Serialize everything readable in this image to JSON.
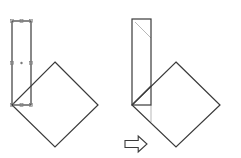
{
  "diagram": {
    "colors": {
      "stroke": "#3a3a3a",
      "guide": "#9a9a9a",
      "handle": "#7a7a7a",
      "background": "#ffffff"
    },
    "panels": [
      {
        "id": "before",
        "rectangle": {
          "x": 12,
          "y": 21,
          "width": 19,
          "height": 84,
          "selected": true
        },
        "diamond": {
          "top": [
            55,
            62
          ],
          "right": [
            98,
            105
          ],
          "bottom": [
            55,
            147
          ],
          "left": [
            12,
            105
          ]
        },
        "handles": [
          [
            12,
            21
          ],
          [
            21.5,
            21
          ],
          [
            31,
            21
          ],
          [
            12,
            63
          ],
          [
            31,
            63
          ],
          [
            12,
            105
          ],
          [
            21.5,
            105
          ],
          [
            31,
            105
          ]
        ],
        "center_marker": [
          21.5,
          63
        ]
      },
      {
        "id": "after",
        "rectangle": {
          "x": 132,
          "y": 19,
          "width": 19,
          "height": 86,
          "selected": false
        },
        "diamond": {
          "top": [
            176,
            62
          ],
          "right": [
            220,
            105
          ],
          "bottom": [
            176,
            147
          ],
          "left": [
            132,
            105
          ]
        },
        "guide_lines": [
          {
            "from": [
              135,
              22
            ],
            "to": [
              151,
              38
            ]
          },
          {
            "from": [
              151,
              105
            ],
            "to": [
              151,
              122
            ]
          }
        ]
      }
    ],
    "arrow": {
      "direction": "right",
      "x": 125,
      "y": 136,
      "width": 22,
      "height": 16
    }
  }
}
